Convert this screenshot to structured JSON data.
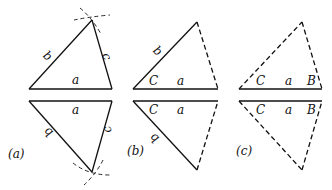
{
  "panels": [
    {
      "caption": "(a)",
      "top": {
        "base": "a",
        "left_side": "b",
        "right_side": "c"
      },
      "bottom": {
        "base": "a",
        "left_side": "b",
        "right_side": "c"
      },
      "construction_arcs": true
    },
    {
      "caption": "(b)",
      "top": {
        "base": "a",
        "left_side": "b",
        "angle": "C"
      },
      "bottom": {
        "base": "a",
        "left_side": "b",
        "angle": "C"
      },
      "dashed_side": "right"
    },
    {
      "caption": "(c)",
      "top": {
        "base": "a",
        "left_angle": "C",
        "right_angle": "B"
      },
      "bottom": {
        "base": "a",
        "left_angle": "C",
        "right_angle": "B"
      },
      "dashed_side": "both"
    }
  ],
  "colors": {
    "line": "#111111",
    "background": "#ffffff"
  }
}
